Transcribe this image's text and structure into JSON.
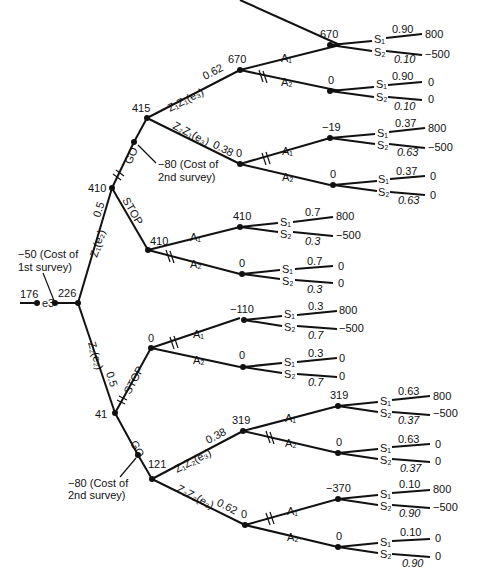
{
  "diagram": {
    "type": "decision-tree",
    "root": {
      "value": "176",
      "label": "e3",
      "value_after": "226"
    },
    "first_survey_cost": "−50 (Cost of",
    "first_survey_cost_2": "1st survey)",
    "second_survey_cost": "−80 (Cost of",
    "second_survey_cost_2": "2nd survey)",
    "upper": {
      "branch": "Z₁(e₂)",
      "prob": "0.5",
      "value": "410",
      "go": "GO",
      "stop": "STOP",
      "go_value": "415",
      "z1z1": {
        "label": "Z₁Z₁(e₃)",
        "prob": "0.62",
        "value": "670",
        "a1": {
          "label": "A₁",
          "value": "670",
          "s1p": "0.90",
          "s1v": "800",
          "s2p": "0.10",
          "s2v": "−500"
        },
        "a2": {
          "label": "A₂",
          "value": "0",
          "s1p": "0.90",
          "s1v": "0",
          "s2p": "0.10",
          "s2v": "0"
        }
      },
      "z2z1": {
        "label": "Z₂Z₁(e₃)",
        "prob": "0.38",
        "value": "0",
        "a1": {
          "label": "A₁",
          "value": "−19",
          "s1p": "0.37",
          "s1v": "800",
          "s2p": "0.63",
          "s2v": "−500"
        },
        "a2": {
          "label": "A₂",
          "value": "0",
          "s1p": "0.37",
          "s1v": "0",
          "s2p": "0.63",
          "s2v": "0"
        }
      },
      "stop_node": {
        "value": "410",
        "a1": {
          "label": "A₁",
          "value": "410",
          "s1p": "0.7",
          "s1v": "800",
          "s2p": "0.3",
          "s2v": "−500"
        },
        "a2": {
          "label": "A₂",
          "value": "0",
          "s1p": "0.7",
          "s1v": "0",
          "s2p": "0.3",
          "s2v": "0"
        }
      }
    },
    "lower": {
      "branch": "Z₂(e₂)",
      "prob": "0.5",
      "value": "41",
      "go": "GO",
      "stop": "STOP",
      "stop_node": {
        "value": "0",
        "a1": {
          "label": "A₁",
          "value": "−110",
          "s1p": "0.3",
          "s1v": "800",
          "s2p": "0.7",
          "s2v": "−500"
        },
        "a2": {
          "label": "A₂",
          "value": "0",
          "s1p": "0.3",
          "s1v": "0",
          "s2p": "0.7",
          "s2v": "0"
        }
      },
      "go_value": "121",
      "z1z2": {
        "label": "Z₁Z₂(e₃)",
        "prob": "0.38",
        "value": "319",
        "a1": {
          "label": "A₁",
          "value": "319",
          "s1p": "0.63",
          "s1v": "800",
          "s2p": "0.37",
          "s2v": "−500"
        },
        "a2": {
          "label": "A₂",
          "value": "0",
          "s1p": "0.63",
          "s1v": "0",
          "s2p": "0.37",
          "s2v": "0"
        }
      },
      "z2z2": {
        "label": "Z₂Z₂(e₃)",
        "prob": "0.62",
        "value": "0",
        "a1": {
          "label": "A₁",
          "value": "−370",
          "s1p": "0.10",
          "s1v": "800",
          "s2p": "0.90",
          "s2v": "−500"
        },
        "a2": {
          "label": "A₂",
          "value": "0",
          "s1p": "0.10",
          "s1v": "0",
          "s2p": "0.90",
          "s2v": "0"
        }
      }
    },
    "state_labels": {
      "s1": "S₁",
      "s2": "S₂"
    }
  }
}
